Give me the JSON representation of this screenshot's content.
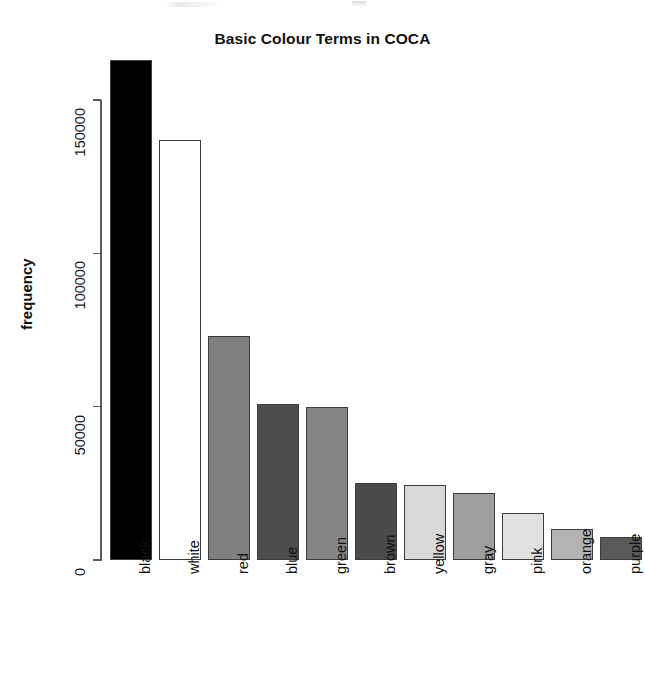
{
  "chart_data": {
    "type": "bar",
    "title": "Basic Colour Terms in COCA",
    "xlabel": "",
    "ylabel": "frequency",
    "categories": [
      "black",
      "white",
      "red",
      "blue",
      "green",
      "brown",
      "yellow",
      "gray",
      "pink",
      "orange",
      "purple"
    ],
    "values": [
      163000,
      137000,
      73000,
      51000,
      50000,
      25000,
      24500,
      22000,
      15300,
      10000,
      7500
    ],
    "bar_colors": [
      "#000000",
      "#ffffff",
      "#808080",
      "#4d4d4d",
      "#858585",
      "#4a4a4a",
      "#d9d9d9",
      "#9e9e9e",
      "#e0e0e0",
      "#b3b3b3",
      "#5a5a5a"
    ],
    "ylim": [
      0,
      163000
    ],
    "y_ticks": [
      0,
      50000,
      100000,
      150000
    ],
    "y_tick_labels": [
      "0",
      "50000",
      "100000",
      "150000"
    ],
    "grid": false,
    "legend": null,
    "axis_color": "#5a5a5a",
    "bar_border_color": "#3d3d3d",
    "background": "#ffffff"
  },
  "chart": {
    "title": "Basic Colour Terms in COCA",
    "y_axis_title": "frequency"
  }
}
